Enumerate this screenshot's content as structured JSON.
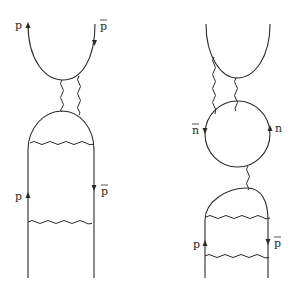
{
  "diagrams": [
    {
      "name": "left-diagram",
      "labels": {
        "top_left": "p",
        "top_right": "p",
        "bottom_left": "p",
        "bottom_right": "p"
      },
      "antiparticle_labels": [
        "top_right",
        "bottom_right"
      ]
    },
    {
      "name": "right-diagram",
      "labels": {
        "loop_left": "n",
        "loop_right": "n",
        "bottom_left": "p",
        "bottom_right": "p"
      },
      "antiparticle_labels": [
        "loop_left",
        "bottom_right"
      ]
    }
  ],
  "colors": {
    "stroke": "#2a2a2a",
    "background": "#ffffff"
  }
}
